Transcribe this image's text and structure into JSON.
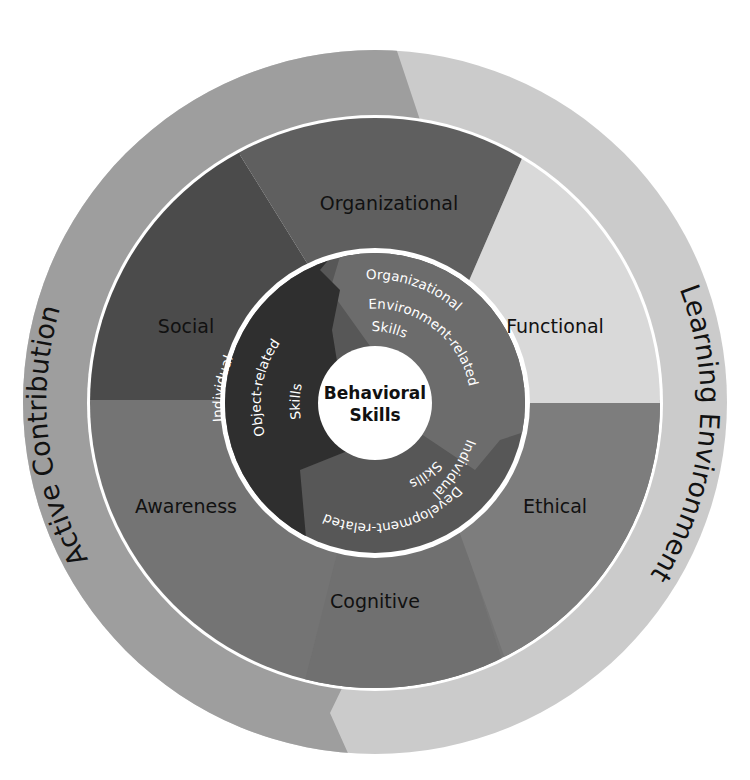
{
  "diagram": {
    "type": "concentric-ring-diagram",
    "core": {
      "line1": "Behavioral",
      "line2": "Skills"
    },
    "inner_ring": [
      {
        "id": "object",
        "lines": [
          "Individual",
          "Object-related",
          "Skills"
        ],
        "color": "#2f2f2f"
      },
      {
        "id": "organizational-env",
        "lines": [
          "Organizational",
          "Environment-related",
          "Skills"
        ],
        "color": "#6c6c6c"
      },
      {
        "id": "development",
        "lines": [
          "Individual",
          "Development-related",
          "Skills"
        ],
        "color": "#575757"
      }
    ],
    "middle_ring": [
      {
        "id": "organizational",
        "label": "Organizational",
        "color": "#5f5f5f"
      },
      {
        "id": "functional",
        "label": "Functional",
        "color": "#d9d9d9"
      },
      {
        "id": "ethical",
        "label": "Ethical",
        "color": "#7d7d7d"
      },
      {
        "id": "cognitive",
        "label": "Cognitive",
        "color": "#727272"
      },
      {
        "id": "awareness",
        "label": "Awareness",
        "color": "#767676"
      },
      {
        "id": "social",
        "label": "Social",
        "color": "#4b4b4b"
      }
    ],
    "outer_ring": [
      {
        "id": "active-contribution",
        "label": "Active Contribution",
        "color": "#9e9e9e"
      },
      {
        "id": "learning-environment",
        "label": "Learning Environment",
        "color": "#cbcbcb"
      }
    ]
  }
}
